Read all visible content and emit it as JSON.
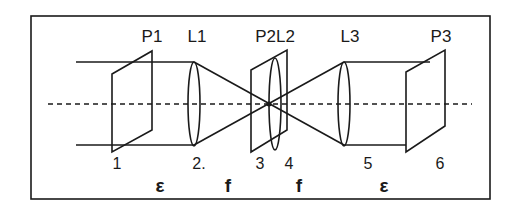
{
  "diagram": {
    "type": "optical-setup",
    "colors": {
      "stroke": "#1a1a1a",
      "background": "#ffffff"
    },
    "components": [
      {
        "id": "P1",
        "label": "P1",
        "kind": "plane"
      },
      {
        "id": "L1",
        "label": "L1",
        "kind": "lens"
      },
      {
        "id": "P2L2",
        "label": "P2L2",
        "kind": "plane+lens"
      },
      {
        "id": "L3",
        "label": "L3",
        "kind": "lens"
      },
      {
        "id": "P3",
        "label": "P3",
        "kind": "plane"
      }
    ],
    "positions": [
      "1",
      "2.",
      "3",
      "4",
      "5",
      "6"
    ],
    "distances": [
      "ε",
      "f",
      "f",
      "ε"
    ],
    "axis": "optical axis (dashed)"
  }
}
